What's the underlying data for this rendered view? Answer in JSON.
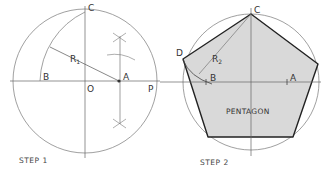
{
  "step1": {
    "caption": "STEP 1",
    "labels": {
      "C": "C",
      "B": "B",
      "O": "O",
      "A": "A",
      "P": "P",
      "R": "R",
      "R_sub": "1"
    }
  },
  "step2": {
    "caption": "STEP 2",
    "labels": {
      "C": "C",
      "D": "D",
      "B": "B",
      "A": "A",
      "R": "R",
      "R_sub": "2"
    },
    "shape_label": "PENTAGON"
  },
  "colors": {
    "line": "#555555",
    "thin": "#888888",
    "fill": "#d9d9d9",
    "outline": "#222222"
  }
}
